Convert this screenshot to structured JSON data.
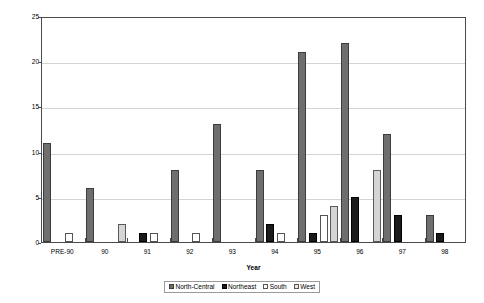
{
  "chart_data": {
    "type": "bar",
    "title": "",
    "xlabel": "Year",
    "ylabel": "Number Enacted",
    "ylim": [
      0,
      25
    ],
    "yticks": [
      0,
      5,
      10,
      15,
      20,
      25
    ],
    "grid": true,
    "legend_position": "bottom",
    "categories": [
      "PRE-90",
      "90",
      "91",
      "92",
      "93",
      "94",
      "95",
      "96",
      "97",
      "98"
    ],
    "series": [
      {
        "name": "North-Central",
        "color": "#6e6e6e",
        "values": [
          11,
          6,
          0,
          8,
          13,
          8,
          21,
          22,
          12,
          3
        ]
      },
      {
        "name": "Northeast",
        "color": "#1a1a1a",
        "values": [
          0,
          0,
          1,
          0,
          0,
          2,
          1,
          5,
          3,
          1
        ]
      },
      {
        "name": "South",
        "color": "#ffffff",
        "values": [
          1,
          0,
          1,
          1,
          0,
          1,
          3,
          0,
          0,
          0
        ]
      },
      {
        "name": "West",
        "color": "#d5d5d5",
        "values": [
          0,
          2,
          0,
          0,
          0,
          0,
          4,
          8,
          0,
          0
        ]
      }
    ]
  },
  "axes": {
    "y_title": "Number Enacted",
    "x_title": "Year",
    "y_tick_labels": [
      "0",
      "5",
      "10",
      "15",
      "20",
      "25"
    ],
    "x_tick_labels": [
      "PRE-90",
      "90",
      "91",
      "92",
      "93",
      "94",
      "95",
      "96",
      "97",
      "98"
    ]
  },
  "legend": {
    "entries": [
      {
        "label": "North-Central"
      },
      {
        "label": "Northeast"
      },
      {
        "label": "South"
      },
      {
        "label": "West"
      }
    ]
  }
}
